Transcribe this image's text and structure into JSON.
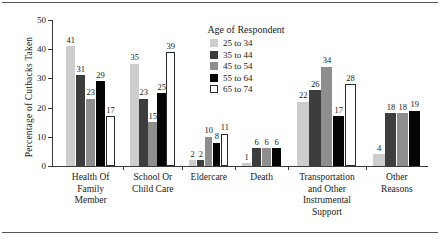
{
  "chart_data": {
    "type": "bar",
    "title": "",
    "xlabel": "",
    "ylabel": "Percentage of Cutbacks Taken",
    "ylim": [
      0,
      50
    ],
    "yticks": [
      0,
      10,
      20,
      30,
      40,
      50
    ],
    "grid": false,
    "legend_position": "top-center-inside",
    "legend_title": "Age of Respondent",
    "categories": [
      "Health Of Family Member",
      "School Or Child Care",
      "Eldercare",
      "Death",
      "Transportation and Other Instrumental Support",
      "Other Reasons"
    ],
    "series": [
      {
        "name": "25 to 34",
        "values": [
          41,
          35,
          2,
          1,
          22,
          4
        ]
      },
      {
        "name": "35 to 44",
        "values": [
          31,
          23,
          2,
          6,
          26,
          18
        ]
      },
      {
        "name": "45 to 54",
        "values": [
          23,
          15,
          10,
          6,
          34,
          18
        ]
      },
      {
        "name": "55 to 64",
        "values": [
          29,
          25,
          8,
          6,
          17,
          19
        ]
      },
      {
        "name": "65 to 74",
        "values": [
          17,
          39,
          11,
          null,
          28,
          null
        ]
      }
    ]
  },
  "axis": {
    "ylabel": "Percentage of Cutbacks Taken",
    "ticks": [
      "0",
      "10",
      "20",
      "30",
      "40",
      "50"
    ]
  },
  "legend": {
    "title": "Age of Respondent",
    "items": [
      {
        "label": "25 to 34",
        "color": "#cdcdcd"
      },
      {
        "label": "35 to 44",
        "color": "#3d3d3d"
      },
      {
        "label": "45 to 54",
        "color": "#8e8e8e"
      },
      {
        "label": "55 to 64",
        "color": "#050505"
      },
      {
        "label": "65 to 74",
        "color": "#ffffff"
      }
    ]
  },
  "categories": [
    {
      "lines": [
        "Health Of",
        "Family",
        "Member"
      ]
    },
    {
      "lines": [
        "School Or",
        "Child Care"
      ]
    },
    {
      "lines": [
        "Eldercare"
      ]
    },
    {
      "lines": [
        "Death"
      ]
    },
    {
      "lines": [
        "Transportation",
        "and Other",
        "Instrumental",
        "Support"
      ]
    },
    {
      "lines": [
        "Other",
        "Reasons"
      ]
    }
  ]
}
